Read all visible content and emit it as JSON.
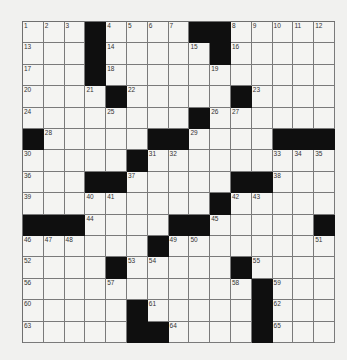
{
  "puzzle": {
    "rows": 15,
    "cols": 15,
    "colors": {
      "background": "#f1f1ef",
      "cell": "#f4f4f2",
      "block": "#0f0f0f",
      "gridline": "#7a7a7a"
    },
    "grid": [
      [
        "1",
        "2",
        "3",
        "#",
        "4",
        "5",
        "6",
        "7",
        "#",
        "#",
        "8",
        "9",
        "10",
        "11",
        "12"
      ],
      [
        "13",
        ".",
        ".",
        "#",
        "14",
        ".",
        ".",
        ".",
        "15",
        "#",
        "16",
        ".",
        ".",
        ".",
        "."
      ],
      [
        "17",
        ".",
        ".",
        "#",
        "18",
        ".",
        ".",
        ".",
        ".",
        "19",
        ".",
        ".",
        ".",
        ".",
        "."
      ],
      [
        "20",
        ".",
        ".",
        "21",
        "#",
        "22",
        ".",
        ".",
        ".",
        ".",
        "#",
        "23",
        ".",
        ".",
        "."
      ],
      [
        "24",
        ".",
        ".",
        ".",
        "25",
        ".",
        ".",
        ".",
        "#",
        "26",
        "27",
        ".",
        ".",
        ".",
        "."
      ],
      [
        "#",
        "28",
        ".",
        ".",
        ".",
        ".",
        "#",
        "#",
        "29",
        ".",
        ".",
        ".",
        "#",
        "#",
        "#"
      ],
      [
        "30",
        ".",
        ".",
        ".",
        ".",
        "#",
        "31",
        "32",
        ".",
        ".",
        ".",
        ".",
        "33",
        "34",
        "35"
      ],
      [
        "36",
        ".",
        ".",
        "#",
        "#",
        "37",
        ".",
        ".",
        ".",
        ".",
        "#",
        "#",
        "38",
        ".",
        "."
      ],
      [
        "39",
        ".",
        ".",
        "40",
        "41",
        ".",
        ".",
        ".",
        ".",
        "#",
        "42",
        "43",
        ".",
        ".",
        "."
      ],
      [
        "#",
        "#",
        "#",
        "44",
        ".",
        ".",
        ".",
        "#",
        "#",
        "45",
        ".",
        ".",
        ".",
        ".",
        "#"
      ],
      [
        "46",
        "47",
        "48",
        ".",
        ".",
        ".",
        "#",
        "49",
        "50",
        ".",
        ".",
        ".",
        ".",
        ".",
        "51"
      ],
      [
        "52",
        ".",
        ".",
        ".",
        "#",
        "53",
        "54",
        ".",
        ".",
        ".",
        "#",
        "55",
        ".",
        ".",
        "."
      ],
      [
        "56",
        ".",
        ".",
        ".",
        "57",
        ".",
        ".",
        ".",
        ".",
        ".",
        "58",
        "#",
        "59",
        ".",
        "."
      ],
      [
        "60",
        ".",
        ".",
        ".",
        ".",
        "#",
        "61",
        ".",
        ".",
        ".",
        ".",
        "#",
        "62",
        ".",
        "."
      ],
      [
        "63",
        ".",
        ".",
        ".",
        ".",
        "#",
        "#",
        "64",
        ".",
        ".",
        ".",
        "#",
        "65",
        ".",
        "."
      ]
    ]
  }
}
